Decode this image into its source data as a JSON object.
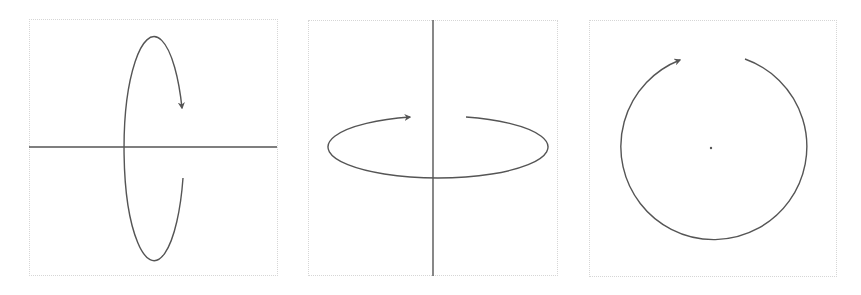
{
  "figure": {
    "panels": [
      {
        "id": "rotation-about-horizontal-axis",
        "axis": "horizontal",
        "rotation_path": "vertical-ellipse",
        "arrow_direction": "down"
      },
      {
        "id": "rotation-about-vertical-axis",
        "axis": "vertical",
        "rotation_path": "horizontal-ellipse",
        "arrow_direction": "right"
      },
      {
        "id": "rotation-about-point",
        "axis": "point (out of plane)",
        "rotation_path": "circle",
        "arrow_direction": "clockwise"
      }
    ],
    "colors": {
      "stroke": "#555555",
      "frame": "#d6d6d6",
      "background": "#ffffff"
    }
  }
}
